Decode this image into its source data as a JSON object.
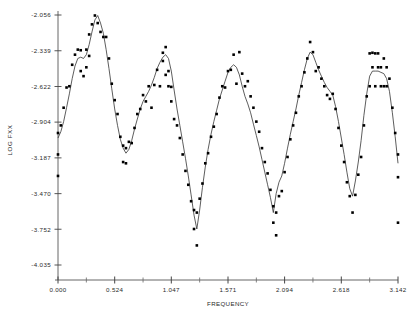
{
  "chart_data": {
    "type": "scatter",
    "title": "",
    "xlabel": "FREQUENCY",
    "ylabel": "LOG FXX",
    "xlim": [
      0.0,
      3.142
    ],
    "ylim": [
      -4.035,
      -2.056
    ],
    "grid": false,
    "legend": null,
    "xticklabels": [
      "0.000",
      "0.524",
      "1.047",
      "1.571",
      "2.094",
      "2.618",
      "3.142"
    ],
    "xtickvalues": [
      0.0,
      0.524,
      1.047,
      1.571,
      2.094,
      2.618,
      3.142
    ],
    "yticklabels": [
      "-2.056",
      "-2.339",
      "-2.622",
      "-2.904",
      "-3.187",
      "-3.470",
      "-3.752",
      "-4.035"
    ],
    "ytickvalues": [
      -2.056,
      -2.339,
      -2.622,
      -2.904,
      -3.187,
      -3.47,
      -3.752,
      -4.035
    ],
    "minor_xticks": [
      0.262,
      0.786,
      1.309,
      1.833,
      2.356,
      2.88
    ],
    "series": [
      {
        "name": "periodogram points",
        "marker": "filled-square",
        "color": "#000000",
        "points": [
          [
            0.0,
            -2.99
          ],
          [
            0.0,
            -3.16
          ],
          [
            0.0,
            -3.33
          ],
          [
            0.026,
            -2.93
          ],
          [
            0.052,
            -2.79
          ],
          [
            0.079,
            -2.63
          ],
          [
            0.105,
            -2.62
          ],
          [
            0.131,
            -2.45
          ],
          [
            0.157,
            -2.37
          ],
          [
            0.183,
            -2.33
          ],
          [
            0.21,
            -2.5
          ],
          [
            0.21,
            -2.335
          ],
          [
            0.236,
            -2.54
          ],
          [
            0.262,
            -2.47
          ],
          [
            0.262,
            -2.33
          ],
          [
            0.288,
            -2.38
          ],
          [
            0.288,
            -2.21
          ],
          [
            0.314,
            -2.13
          ],
          [
            0.341,
            -2.06
          ],
          [
            0.367,
            -2.12
          ],
          [
            0.393,
            -2.19
          ],
          [
            0.419,
            -2.23
          ],
          [
            0.445,
            -2.23
          ],
          [
            0.471,
            -2.4
          ],
          [
            0.497,
            -2.6
          ],
          [
            0.524,
            -2.73
          ],
          [
            0.55,
            -2.84
          ],
          [
            0.576,
            -3.02
          ],
          [
            0.602,
            -3.09
          ],
          [
            0.602,
            -3.22
          ],
          [
            0.628,
            -3.11
          ],
          [
            0.628,
            -3.23
          ],
          [
            0.655,
            -3.06
          ],
          [
            0.681,
            -3.07
          ],
          [
            0.707,
            -2.95
          ],
          [
            0.733,
            -2.84
          ],
          [
            0.76,
            -2.8
          ],
          [
            0.786,
            -2.69
          ],
          [
            0.812,
            -2.74
          ],
          [
            0.838,
            -2.62
          ],
          [
            0.864,
            -2.79
          ],
          [
            0.89,
            -2.61
          ],
          [
            0.916,
            -2.49
          ],
          [
            0.942,
            -2.62
          ],
          [
            0.969,
            -2.42
          ],
          [
            0.969,
            -2.355
          ],
          [
            0.995,
            -2.53
          ],
          [
            0.995,
            -2.31
          ],
          [
            1.021,
            -2.5
          ],
          [
            1.021,
            -2.62
          ],
          [
            1.047,
            -2.625
          ],
          [
            1.047,
            -2.74
          ],
          [
            1.073,
            -2.88
          ],
          [
            1.1,
            -2.93
          ],
          [
            1.126,
            -3.03
          ],
          [
            1.152,
            -3.16
          ],
          [
            1.178,
            -3.29
          ],
          [
            1.204,
            -3.4
          ],
          [
            1.23,
            -3.53
          ],
          [
            1.257,
            -3.6
          ],
          [
            1.257,
            -3.75
          ],
          [
            1.283,
            -3.88
          ],
          [
            1.283,
            -3.62
          ],
          [
            1.309,
            -3.51
          ],
          [
            1.335,
            -3.39
          ],
          [
            1.361,
            -3.23
          ],
          [
            1.387,
            -3.15
          ],
          [
            1.414,
            -3.02
          ],
          [
            1.44,
            -2.94
          ],
          [
            1.466,
            -2.84
          ],
          [
            1.492,
            -2.71
          ],
          [
            1.518,
            -2.62
          ],
          [
            1.544,
            -2.63
          ],
          [
            1.571,
            -2.5
          ],
          [
            1.597,
            -2.49
          ],
          [
            1.623,
            -2.37
          ],
          [
            1.649,
            -2.6
          ],
          [
            1.676,
            -2.35
          ],
          [
            1.702,
            -2.52
          ],
          [
            1.728,
            -2.62
          ],
          [
            1.754,
            -2.58
          ],
          [
            1.78,
            -2.7
          ],
          [
            1.806,
            -2.79
          ],
          [
            1.833,
            -2.9
          ],
          [
            1.859,
            -2.98
          ],
          [
            1.885,
            -3.11
          ],
          [
            1.911,
            -3.22
          ],
          [
            1.937,
            -3.31
          ],
          [
            1.963,
            -3.44
          ],
          [
            1.99,
            -3.57
          ],
          [
            1.99,
            -3.7
          ],
          [
            2.016,
            -3.8
          ],
          [
            2.016,
            -3.62
          ],
          [
            2.042,
            -3.49
          ],
          [
            2.068,
            -3.45
          ],
          [
            2.094,
            -3.3
          ],
          [
            2.121,
            -3.18
          ],
          [
            2.147,
            -3.04
          ],
          [
            2.173,
            -2.93
          ],
          [
            2.199,
            -2.83
          ],
          [
            2.225,
            -2.7
          ],
          [
            2.251,
            -2.62
          ],
          [
            2.277,
            -2.51
          ],
          [
            2.304,
            -2.4
          ],
          [
            2.33,
            -2.27
          ],
          [
            2.356,
            -2.35
          ],
          [
            2.382,
            -2.5
          ],
          [
            2.408,
            -2.47
          ],
          [
            2.434,
            -2.56
          ],
          [
            2.461,
            -2.62
          ],
          [
            2.487,
            -2.69
          ],
          [
            2.513,
            -2.72
          ],
          [
            2.539,
            -2.68
          ],
          [
            2.565,
            -2.8
          ],
          [
            2.592,
            -2.95
          ],
          [
            2.618,
            -3.09
          ],
          [
            2.644,
            -3.22
          ],
          [
            2.67,
            -3.38
          ],
          [
            2.696,
            -3.49
          ],
          [
            2.722,
            -3.62
          ],
          [
            2.748,
            -3.48
          ],
          [
            2.775,
            -3.32
          ],
          [
            2.801,
            -3.18
          ],
          [
            2.827,
            -2.93
          ],
          [
            2.853,
            -2.7
          ],
          [
            2.88,
            -2.62
          ],
          [
            2.88,
            -2.36
          ],
          [
            2.906,
            -2.47
          ],
          [
            2.906,
            -2.355
          ],
          [
            2.932,
            -2.62
          ],
          [
            2.932,
            -2.36
          ],
          [
            2.958,
            -2.47
          ],
          [
            2.958,
            -2.36
          ],
          [
            2.984,
            -2.62
          ],
          [
            2.984,
            -2.47
          ],
          [
            3.011,
            -2.62
          ],
          [
            3.011,
            -2.4
          ],
          [
            3.037,
            -2.47
          ],
          [
            3.037,
            -2.62
          ],
          [
            3.063,
            -2.56
          ],
          [
            3.09,
            -2.79
          ],
          [
            3.116,
            -2.99
          ],
          [
            3.142,
            -3.16
          ],
          [
            3.142,
            -3.34
          ],
          [
            3.142,
            -3.7
          ]
        ]
      },
      {
        "name": "smoothed spectral estimate",
        "marker": "line",
        "color": "#333333",
        "points": [
          [
            0.0,
            -3.03
          ],
          [
            0.026,
            -2.98
          ],
          [
            0.052,
            -2.9
          ],
          [
            0.079,
            -2.79
          ],
          [
            0.105,
            -2.68
          ],
          [
            0.131,
            -2.56
          ],
          [
            0.157,
            -2.46
          ],
          [
            0.183,
            -2.4
          ],
          [
            0.21,
            -2.39
          ],
          [
            0.236,
            -2.4
          ],
          [
            0.262,
            -2.37
          ],
          [
            0.288,
            -2.29
          ],
          [
            0.314,
            -2.19
          ],
          [
            0.341,
            -2.095
          ],
          [
            0.367,
            -2.06
          ],
          [
            0.393,
            -2.12
          ],
          [
            0.419,
            -2.2
          ],
          [
            0.445,
            -2.33
          ],
          [
            0.471,
            -2.48
          ],
          [
            0.497,
            -2.64
          ],
          [
            0.524,
            -2.8
          ],
          [
            0.55,
            -2.93
          ],
          [
            0.576,
            -3.04
          ],
          [
            0.602,
            -3.11
          ],
          [
            0.628,
            -3.15
          ],
          [
            0.655,
            -3.12
          ],
          [
            0.681,
            -3.05
          ],
          [
            0.707,
            -2.96
          ],
          [
            0.733,
            -2.88
          ],
          [
            0.76,
            -2.8
          ],
          [
            0.786,
            -2.74
          ],
          [
            0.812,
            -2.7
          ],
          [
            0.838,
            -2.66
          ],
          [
            0.864,
            -2.61
          ],
          [
            0.89,
            -2.55
          ],
          [
            0.916,
            -2.48
          ],
          [
            0.942,
            -2.43
          ],
          [
            0.969,
            -2.39
          ],
          [
            0.995,
            -2.37
          ],
          [
            1.021,
            -2.4
          ],
          [
            1.047,
            -2.5
          ],
          [
            1.073,
            -2.65
          ],
          [
            1.1,
            -2.8
          ],
          [
            1.126,
            -2.93
          ],
          [
            1.152,
            -3.06
          ],
          [
            1.178,
            -3.19
          ],
          [
            1.204,
            -3.33
          ],
          [
            1.23,
            -3.48
          ],
          [
            1.257,
            -3.64
          ],
          [
            1.283,
            -3.75
          ],
          [
            1.309,
            -3.6
          ],
          [
            1.335,
            -3.42
          ],
          [
            1.361,
            -3.26
          ],
          [
            1.387,
            -3.12
          ],
          [
            1.414,
            -3.0
          ],
          [
            1.44,
            -2.9
          ],
          [
            1.466,
            -2.81
          ],
          [
            1.492,
            -2.72
          ],
          [
            1.518,
            -2.65
          ],
          [
            1.544,
            -2.58
          ],
          [
            1.571,
            -2.51
          ],
          [
            1.597,
            -2.47
          ],
          [
            1.623,
            -2.45
          ],
          [
            1.649,
            -2.47
          ],
          [
            1.676,
            -2.53
          ],
          [
            1.702,
            -2.62
          ],
          [
            1.728,
            -2.7
          ],
          [
            1.754,
            -2.76
          ],
          [
            1.78,
            -2.83
          ],
          [
            1.806,
            -2.92
          ],
          [
            1.833,
            -3.01
          ],
          [
            1.859,
            -3.1
          ],
          [
            1.885,
            -3.2
          ],
          [
            1.911,
            -3.3
          ],
          [
            1.937,
            -3.4
          ],
          [
            1.963,
            -3.5
          ],
          [
            1.99,
            -3.62
          ],
          [
            2.016,
            -3.47
          ],
          [
            2.042,
            -3.38
          ],
          [
            2.068,
            -3.33
          ],
          [
            2.094,
            -3.23
          ],
          [
            2.121,
            -3.11
          ],
          [
            2.147,
            -3.0
          ],
          [
            2.173,
            -2.9
          ],
          [
            2.199,
            -2.8
          ],
          [
            2.225,
            -2.69
          ],
          [
            2.251,
            -2.59
          ],
          [
            2.277,
            -2.49
          ],
          [
            2.304,
            -2.4
          ],
          [
            2.33,
            -2.35
          ],
          [
            2.356,
            -2.37
          ],
          [
            2.382,
            -2.43
          ],
          [
            2.408,
            -2.49
          ],
          [
            2.434,
            -2.54
          ],
          [
            2.461,
            -2.59
          ],
          [
            2.487,
            -2.63
          ],
          [
            2.513,
            -2.66
          ],
          [
            2.539,
            -2.69
          ],
          [
            2.565,
            -2.78
          ],
          [
            2.592,
            -2.9
          ],
          [
            2.618,
            -3.03
          ],
          [
            2.644,
            -3.16
          ],
          [
            2.67,
            -3.3
          ],
          [
            2.696,
            -3.43
          ],
          [
            2.722,
            -3.49
          ],
          [
            2.748,
            -3.37
          ],
          [
            2.775,
            -3.22
          ],
          [
            2.801,
            -3.05
          ],
          [
            2.827,
            -2.85
          ],
          [
            2.853,
            -2.68
          ],
          [
            2.88,
            -2.54
          ],
          [
            2.906,
            -2.5
          ],
          [
            2.932,
            -2.5
          ],
          [
            2.958,
            -2.5
          ],
          [
            2.984,
            -2.51
          ],
          [
            3.011,
            -2.52
          ],
          [
            3.037,
            -2.56
          ],
          [
            3.063,
            -2.66
          ],
          [
            3.09,
            -2.83
          ],
          [
            3.116,
            -3.02
          ],
          [
            3.142,
            -3.23
          ]
        ]
      }
    ]
  },
  "axes": {
    "x_axis_title": "FREQUENCY",
    "y_axis_title": "LOG FXX"
  }
}
